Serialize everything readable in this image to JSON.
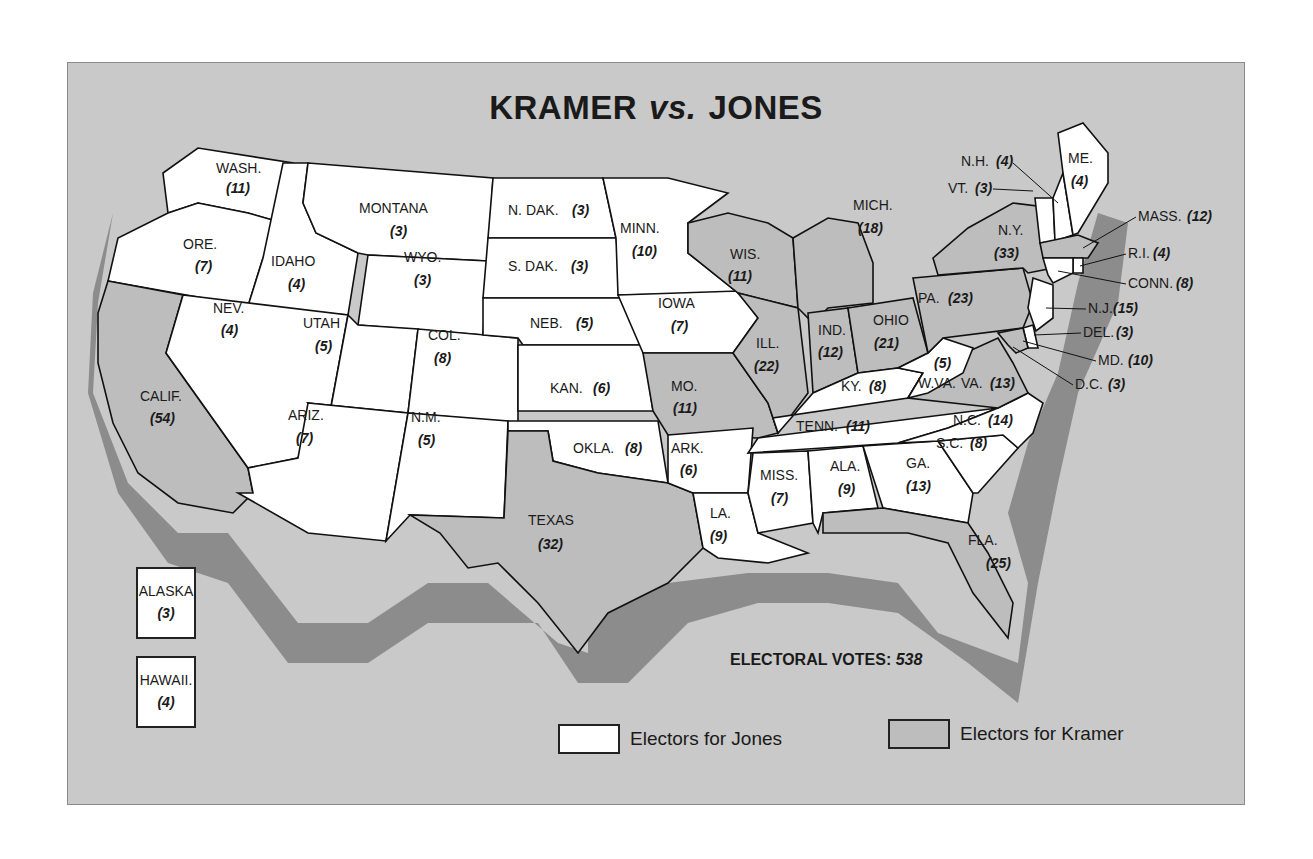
{
  "title": {
    "left": "KRAMER",
    "vs": "vs.",
    "right": "JONES"
  },
  "colors": {
    "background": "#c9c9c9",
    "jones": "#ffffff",
    "kramer": "#bdbdbd",
    "shadow": "#8c8c8c",
    "border": "#111111"
  },
  "legend": {
    "jones_label": "Electors for Jones",
    "kramer_label": "Electors for Kramer"
  },
  "total": {
    "label": "ELECTORAL VOTES:",
    "value": "538"
  },
  "insets": {
    "alaska": {
      "label": "ALASKA",
      "votes": "(3)",
      "winner": "jones"
    },
    "hawaii": {
      "label": "HAWAII.",
      "votes": "(4)",
      "winner": "jones"
    }
  },
  "states": {
    "wash": {
      "label": "WASH.",
      "votes": "(11)",
      "winner": "jones"
    },
    "ore": {
      "label": "ORE.",
      "votes": "(7)",
      "winner": "jones"
    },
    "calif": {
      "label": "CALIF.",
      "votes": "(54)",
      "winner": "kramer"
    },
    "idaho": {
      "label": "IDAHO",
      "votes": "(4)",
      "winner": "jones"
    },
    "nev": {
      "label": "NEV.",
      "votes": "(4)",
      "winner": "jones"
    },
    "montana": {
      "label": "MONTANA",
      "votes": "(3)",
      "winner": "jones"
    },
    "wyo": {
      "label": "WYO.",
      "votes": "(3)",
      "winner": "jones"
    },
    "utah": {
      "label": "UTAH",
      "votes": "(5)",
      "winner": "jones"
    },
    "col": {
      "label": "COL.",
      "votes": "(8)",
      "winner": "jones"
    },
    "ariz": {
      "label": "ARIZ.",
      "votes": "(7)",
      "winner": "jones"
    },
    "nm": {
      "label": "N.M.",
      "votes": "(5)",
      "winner": "jones"
    },
    "ndak": {
      "label": "N. DAK.",
      "votes": "(3)",
      "winner": "jones"
    },
    "sdak": {
      "label": "S. DAK.",
      "votes": "(3)",
      "winner": "jones"
    },
    "neb": {
      "label": "NEB.",
      "votes": "(5)",
      "winner": "jones"
    },
    "kan": {
      "label": "KAN.",
      "votes": "(6)",
      "winner": "jones"
    },
    "okla": {
      "label": "OKLA.",
      "votes": "(8)",
      "winner": "jones"
    },
    "texas": {
      "label": "TEXAS",
      "votes": "(32)",
      "winner": "kramer"
    },
    "minn": {
      "label": "MINN.",
      "votes": "(10)",
      "winner": "jones"
    },
    "iowa": {
      "label": "IOWA",
      "votes": "(7)",
      "winner": "jones"
    },
    "mo": {
      "label": "MO.",
      "votes": "(11)",
      "winner": "kramer"
    },
    "ark": {
      "label": "ARK.",
      "votes": "(6)",
      "winner": "jones"
    },
    "la": {
      "label": "LA.",
      "votes": "(9)",
      "winner": "jones"
    },
    "wis": {
      "label": "WIS.",
      "votes": "(11)",
      "winner": "kramer"
    },
    "ill": {
      "label": "ILL.",
      "votes": "(22)",
      "winner": "kramer"
    },
    "mich": {
      "label": "MICH.",
      "votes": "(18)",
      "winner": "kramer"
    },
    "ind": {
      "label": "IND.",
      "votes": "(12)",
      "winner": "kramer"
    },
    "ohio": {
      "label": "OHIO",
      "votes": "(21)",
      "winner": "kramer"
    },
    "ky": {
      "label": "KY.",
      "votes": "(8)",
      "winner": "jones"
    },
    "tenn": {
      "label": "TENN.",
      "votes": "(11)",
      "winner": "jones"
    },
    "miss": {
      "label": "MISS.",
      "votes": "(7)",
      "winner": "jones"
    },
    "ala": {
      "label": "ALA.",
      "votes": "(9)",
      "winner": "jones"
    },
    "ga": {
      "label": "GA.",
      "votes": "(13)",
      "winner": "jones"
    },
    "fla": {
      "label": "FLA.",
      "votes": "(25)",
      "winner": "kramer"
    },
    "sc": {
      "label": "S.C.",
      "votes": "(8)",
      "winner": "jones"
    },
    "nc": {
      "label": "N.C.",
      "votes": "(14)",
      "winner": "jones"
    },
    "va": {
      "label": "VA.",
      "votes": "(13)",
      "winner": "kramer"
    },
    "wva": {
      "label": "W.VA.",
      "votes": "(5)",
      "winner": "jones"
    },
    "pa": {
      "label": "PA.",
      "votes": "(23)",
      "winner": "kramer"
    },
    "ny": {
      "label": "N.Y.",
      "votes": "(33)",
      "winner": "kramer"
    },
    "vt": {
      "label": "VT.",
      "votes": "(3)",
      "winner": "jones"
    },
    "nh": {
      "label": "N.H.",
      "votes": "(4)",
      "winner": "jones"
    },
    "me": {
      "label": "ME.",
      "votes": "(4)",
      "winner": "jones"
    },
    "mass": {
      "label": "MASS.",
      "votes": "(12)",
      "winner": "kramer"
    },
    "ri": {
      "label": "R.I.",
      "votes": "(4)",
      "winner": "jones"
    },
    "conn": {
      "label": "CONN.",
      "votes": "(8)",
      "winner": "jones"
    },
    "nj": {
      "label": "N.J.",
      "votes": "(15)",
      "winner": "jones"
    },
    "del": {
      "label": "DEL.",
      "votes": "(3)",
      "winner": "jones"
    },
    "md": {
      "label": "MD.",
      "votes": "(10)",
      "winner": "kramer"
    },
    "dc": {
      "label": "D.C.",
      "votes": "(3)",
      "winner": "kramer"
    }
  }
}
